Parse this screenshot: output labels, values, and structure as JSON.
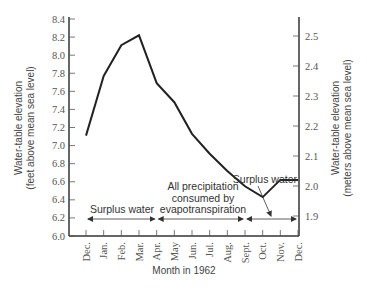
{
  "chart_data": {
    "type": "line",
    "title": "",
    "xlabel": "Month in 1962",
    "ylabel": "Water-table elevation (feet above mean sea level)",
    "ylabel_right": "Water-table elevation (meters above mean sea level)",
    "categories": [
      "Dec.",
      "Jan.",
      "Feb.",
      "Mar.",
      "Apr.",
      "May",
      "Jun.",
      "Jul.",
      "Aug.",
      "Sept.",
      "Oct.",
      "Nov.",
      "Dec."
    ],
    "series": [
      {
        "name": "Water-table elevation",
        "values": [
          7.11,
          7.77,
          8.11,
          8.22,
          7.69,
          7.48,
          7.13,
          6.91,
          6.72,
          6.55,
          6.43,
          6.62,
          6.62
        ]
      }
    ],
    "ylim": [
      6.0,
      8.4
    ],
    "yticks": [
      "6.0",
      "6.2",
      "6.4",
      "6.6",
      "6.8",
      "7.0",
      "7.2",
      "7.4",
      "7.6",
      "7.8",
      "8.0",
      "8.2",
      "8.4"
    ],
    "yticks_right": [
      "1.9",
      "2.0",
      "2.1",
      "2.2",
      "2.3",
      "2.4",
      "2.5"
    ],
    "grid": false,
    "annotations": [
      {
        "text": "Surplus water",
        "span": [
          "Dec.",
          "Apr."
        ]
      },
      {
        "text": "All precipitation consumed by evapotranspiration",
        "span": [
          "Apr.",
          "Sept."
        ]
      },
      {
        "text": "Surplus water",
        "span": [
          "Sept.",
          "Dec."
        ]
      }
    ]
  },
  "labels": {
    "ylabel_left_line1": "Water-table elevation",
    "ylabel_left_line2": "(feet above mean sea level)",
    "ylabel_right_line1": "Water-table elevation",
    "ylabel_right_line2": "(meters above mean sea level)",
    "xlabel": "Month in 1962",
    "ann_surplus_left": "Surplus water",
    "ann_consumed_line1": "All precipitation",
    "ann_consumed_line2": "consumed by",
    "ann_consumed_line3": "evapotranspiration",
    "ann_surplus_right": "Surplus water"
  }
}
